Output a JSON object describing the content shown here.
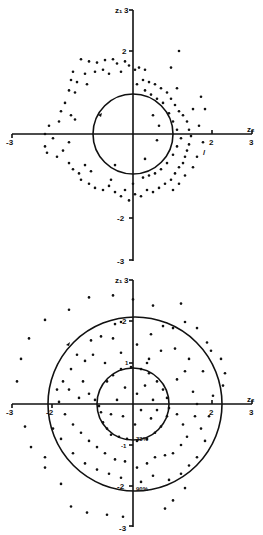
{
  "chart_data": [
    {
      "type": "scatter",
      "title": "",
      "xlabel": "z2",
      "ylabel": "z1",
      "xlim": [
        -3,
        3
      ],
      "ylim": [
        -3,
        3
      ],
      "x_ticks": [
        "-3",
        "2",
        "3"
      ],
      "y_ticks": [
        "3",
        "2",
        "-2",
        "-3"
      ],
      "grid": false,
      "legend": null,
      "annotations": [
        {
          "type": "circle",
          "center": [
            0,
            0
          ],
          "radius": 1.0,
          "with_arrow": true
        },
        {
          "type": "text",
          "text": "/",
          "position": [
            1.8,
            -0.45
          ]
        }
      ],
      "points": [
        [
          -1.3,
          1.8
        ],
        [
          -1.1,
          1.75
        ],
        [
          -0.9,
          1.72
        ],
        [
          -0.7,
          1.78
        ],
        [
          -0.5,
          1.8
        ],
        [
          -0.4,
          1.7
        ],
        [
          -0.2,
          1.75
        ],
        [
          -0.1,
          1.65
        ],
        [
          0.05,
          1.55
        ],
        [
          0.15,
          1.6
        ],
        [
          0.3,
          1.55
        ],
        [
          -1.5,
          1.5
        ],
        [
          -1.2,
          1.45
        ],
        [
          -0.95,
          1.5
        ],
        [
          -0.75,
          1.55
        ],
        [
          -0.6,
          1.45
        ],
        [
          -0.3,
          1.5
        ],
        [
          -1.55,
          1.3
        ],
        [
          -1.4,
          1.25
        ],
        [
          -1.15,
          1.2
        ],
        [
          -1.6,
          1.05
        ],
        [
          -1.45,
          1.0
        ],
        [
          -1.7,
          0.75
        ],
        [
          -1.8,
          0.55
        ],
        [
          -1.85,
          0.3
        ],
        [
          -2.1,
          0.2
        ],
        [
          -2.2,
          0.0
        ],
        [
          -2.0,
          -0.1
        ],
        [
          -2.2,
          -0.3
        ],
        [
          -2.15,
          -0.45
        ],
        [
          -1.9,
          -0.55
        ],
        [
          -1.75,
          -0.4
        ],
        [
          -1.6,
          -0.2
        ],
        [
          -1.55,
          0.45
        ],
        [
          -1.45,
          0.35
        ],
        [
          -1.6,
          -0.7
        ],
        [
          -1.5,
          -0.85
        ],
        [
          -1.35,
          -0.95
        ],
        [
          -1.2,
          -0.75
        ],
        [
          -1.05,
          -0.9
        ],
        [
          -1.3,
          -1.1
        ],
        [
          -1.1,
          -1.2
        ],
        [
          -0.95,
          -1.3
        ],
        [
          -0.75,
          -1.35
        ],
        [
          -0.6,
          -1.25
        ],
        [
          -0.45,
          -1.4
        ],
        [
          -0.3,
          -1.5
        ],
        [
          -0.2,
          -1.35
        ],
        [
          -0.1,
          -1.6
        ],
        [
          0.05,
          -1.45
        ],
        [
          0.2,
          -1.5
        ],
        [
          0.35,
          -1.35
        ],
        [
          0.5,
          -1.4
        ],
        [
          0.65,
          -1.3
        ],
        [
          0.8,
          -1.2
        ],
        [
          0.95,
          -1.1
        ],
        [
          1.05,
          -0.95
        ],
        [
          1.15,
          -0.8
        ],
        [
          1.25,
          -0.7
        ],
        [
          1.3,
          -0.55
        ],
        [
          1.35,
          -0.4
        ],
        [
          1.4,
          -0.25
        ],
        [
          1.45,
          -0.05
        ],
        [
          1.4,
          0.1
        ],
        [
          1.35,
          0.3
        ],
        [
          1.25,
          0.45
        ],
        [
          1.15,
          0.55
        ],
        [
          1.05,
          0.7
        ],
        [
          0.95,
          0.85
        ],
        [
          0.85,
          1.0
        ],
        [
          0.7,
          1.1
        ],
        [
          0.55,
          1.2
        ],
        [
          0.4,
          1.25
        ],
        [
          0.25,
          1.3
        ],
        [
          0.1,
          1.2
        ],
        [
          0.3,
          1.05
        ],
        [
          0.45,
          0.95
        ],
        [
          0.6,
          0.85
        ],
        [
          0.75,
          0.75
        ],
        [
          0.9,
          0.5
        ],
        [
          1.0,
          0.3
        ],
        [
          1.1,
          0.1
        ],
        [
          1.2,
          -0.1
        ],
        [
          1.1,
          -0.3
        ],
        [
          1.0,
          -0.5
        ],
        [
          0.85,
          -0.7
        ],
        [
          0.7,
          -0.85
        ],
        [
          0.55,
          -0.95
        ],
        [
          0.4,
          -1.0
        ],
        [
          0.25,
          -1.05
        ],
        [
          1.7,
          0.9
        ],
        [
          1.8,
          0.6
        ],
        [
          1.5,
          0.6
        ],
        [
          1.65,
          0.2
        ],
        [
          1.75,
          -0.2
        ],
        [
          1.6,
          -0.55
        ],
        [
          1.5,
          -0.8
        ],
        [
          1.3,
          -1.0
        ],
        [
          1.15,
          -1.2
        ],
        [
          1.0,
          -1.35
        ],
        [
          1.15,
          2.0
        ],
        [
          0.95,
          1.6
        ],
        [
          1.1,
          1.1
        ],
        [
          0.5,
          0.45
        ],
        [
          0.65,
          0.2
        ],
        [
          0.3,
          -0.6
        ],
        [
          0.6,
          -0.15
        ],
        [
          0.0,
          -1.2
        ],
        [
          -0.45,
          -0.75
        ],
        [
          -0.55,
          -1.1
        ]
      ]
    },
    {
      "type": "scatter",
      "title": "",
      "xlabel": "z2",
      "ylabel": "z1",
      "xlim": [
        -3,
        3
      ],
      "ylim": [
        -3,
        3
      ],
      "x_ticks": [
        "-3",
        "-2",
        "2",
        "3"
      ],
      "y_ticks": [
        "3",
        "2",
        "1",
        "-1",
        "-2",
        "-3"
      ],
      "grid": false,
      "legend": null,
      "annotations": [
        {
          "type": "circle",
          "center": [
            0,
            0
          ],
          "radius": 0.9,
          "label": "33%",
          "with_arrow": false
        },
        {
          "type": "circle",
          "center": [
            0,
            0
          ],
          "radius": 2.15,
          "label": "90%",
          "with_arrow": true
        }
      ],
      "points": [
        [
          -1.1,
          2.6
        ],
        [
          -0.5,
          2.65
        ],
        [
          0.0,
          2.55
        ],
        [
          1.2,
          2.45
        ],
        [
          0.5,
          2.4
        ],
        [
          -1.6,
          2.3
        ],
        [
          -2.2,
          2.05
        ],
        [
          -2.6,
          1.6
        ],
        [
          -2.8,
          1.1
        ],
        [
          -2.9,
          0.55
        ],
        [
          -2.7,
          -0.55
        ],
        [
          -2.55,
          -1.05
        ],
        [
          -2.2,
          -1.3
        ],
        [
          -2.2,
          -1.55
        ],
        [
          -1.8,
          -1.95
        ],
        [
          -1.55,
          -2.5
        ],
        [
          -1.15,
          -2.65
        ],
        [
          -0.65,
          -2.7
        ],
        [
          -0.25,
          -2.75
        ],
        [
          0.8,
          -2.55
        ],
        [
          1.0,
          -2.35
        ],
        [
          1.3,
          -2.05
        ],
        [
          2.3,
          0.75
        ],
        [
          2.25,
          0.45
        ],
        [
          2.2,
          1.1
        ],
        [
          1.95,
          1.3
        ],
        [
          1.85,
          1.5
        ],
        [
          1.6,
          1.85
        ],
        [
          1.3,
          2.0
        ],
        [
          1.0,
          1.85
        ],
        [
          0.75,
          1.9
        ],
        [
          0.45,
          1.7
        ],
        [
          -0.3,
          2.0
        ],
        [
          -0.45,
          1.95
        ],
        [
          -0.8,
          1.65
        ],
        [
          -0.5,
          1.6
        ],
        [
          -1.05,
          1.55
        ],
        [
          -1.4,
          1.2
        ],
        [
          -1.2,
          1.05
        ],
        [
          -1.55,
          0.85
        ],
        [
          -1.75,
          0.55
        ],
        [
          -1.6,
          0.35
        ],
        [
          -1.35,
          0.15
        ],
        [
          -1.1,
          0.25
        ],
        [
          -0.95,
          0.1
        ],
        [
          -0.85,
          -0.05
        ],
        [
          -0.8,
          -0.2
        ],
        [
          -0.75,
          -0.45
        ],
        [
          -0.65,
          -0.6
        ],
        [
          -0.55,
          -0.75
        ],
        [
          -0.35,
          -0.8
        ],
        [
          -0.15,
          -0.85
        ],
        [
          0.1,
          -0.9
        ],
        [
          0.35,
          -0.85
        ],
        [
          0.55,
          -0.7
        ],
        [
          0.7,
          -0.55
        ],
        [
          0.85,
          -0.3
        ],
        [
          0.9,
          -0.1
        ],
        [
          0.85,
          0.15
        ],
        [
          0.75,
          0.35
        ],
        [
          0.6,
          0.55
        ],
        [
          0.4,
          0.75
        ],
        [
          0.2,
          0.85
        ],
        [
          -0.05,
          0.9
        ],
        [
          -0.3,
          0.85
        ],
        [
          -0.5,
          0.7
        ],
        [
          -0.65,
          0.55
        ],
        [
          0.5,
          0.1
        ],
        [
          0.6,
          -0.15
        ],
        [
          0.45,
          -0.35
        ],
        [
          0.2,
          -0.15
        ],
        [
          0.1,
          0.25
        ],
        [
          -0.2,
          0.4
        ],
        [
          -0.4,
          0.1
        ],
        [
          -0.25,
          -0.3
        ],
        [
          0.05,
          -0.5
        ],
        [
          0.3,
          0.45
        ],
        [
          -0.55,
          -0.25
        ],
        [
          1.1,
          -0.25
        ],
        [
          1.25,
          -0.5
        ],
        [
          1.35,
          -0.8
        ],
        [
          1.2,
          -1.0
        ],
        [
          1.0,
          -1.2
        ],
        [
          0.8,
          -1.25
        ],
        [
          0.55,
          -1.3
        ],
        [
          0.35,
          -1.45
        ],
        [
          0.1,
          -1.55
        ],
        [
          -0.2,
          -1.4
        ],
        [
          -0.45,
          -1.35
        ],
        [
          -0.7,
          -1.2
        ],
        [
          -0.9,
          -1.05
        ],
        [
          -1.1,
          -0.9
        ],
        [
          -1.3,
          -0.7
        ],
        [
          -1.5,
          -0.5
        ],
        [
          -1.7,
          -0.25
        ],
        [
          -1.85,
          0.05
        ],
        [
          -1.9,
          0.35
        ],
        [
          1.5,
          0.3
        ],
        [
          1.6,
          0.0
        ],
        [
          1.55,
          -0.3
        ],
        [
          1.7,
          -0.6
        ],
        [
          1.8,
          -0.9
        ],
        [
          1.6,
          -1.3
        ],
        [
          1.4,
          -1.5
        ],
        [
          1.2,
          -1.7
        ],
        [
          0.9,
          -1.85
        ],
        [
          0.5,
          -1.75
        ],
        [
          0.2,
          -1.9
        ],
        [
          -0.3,
          -1.8
        ],
        [
          -0.6,
          -1.7
        ],
        [
          -0.9,
          -1.6
        ],
        [
          -1.2,
          -1.45
        ],
        [
          -1.5,
          -1.2
        ],
        [
          -1.8,
          -0.85
        ],
        [
          -2.0,
          -0.6
        ],
        [
          1.9,
          -0.3
        ],
        [
          2.0,
          0.2
        ],
        [
          1.75,
          0.8
        ],
        [
          1.4,
          1.1
        ],
        [
          1.05,
          1.35
        ],
        [
          0.7,
          1.3
        ],
        [
          0.4,
          1.1
        ],
        [
          1.1,
          0.6
        ],
        [
          1.3,
          0.8
        ],
        [
          -1.0,
          1.2
        ],
        [
          -0.7,
          1.0
        ],
        [
          -0.3,
          1.25
        ],
        [
          0.1,
          1.45
        ],
        [
          0.35,
          1.0
        ],
        [
          -1.25,
          0.55
        ]
      ]
    }
  ],
  "plots": {
    "top": {
      "y_axis_title": "z₁",
      "x_axis_title": "z₂",
      "y_label_top": "3",
      "y_label_2": "2",
      "y_label_neg2": "-2",
      "y_label_neg3": "-3",
      "x_label_neg3": "-3",
      "x_label_2": "2",
      "x_label_3": "3",
      "mark": "/"
    },
    "bottom": {
      "y_axis_title": "z₁",
      "x_axis_title": "z₂",
      "y_label_top": "3",
      "y_label_2": "2",
      "y_label_1": "1",
      "y_label_neg1": "-1",
      "y_label_neg2": "-2",
      "y_label_neg3": "-3",
      "x_label_neg3": "-3",
      "x_label_neg2": "-2",
      "x_label_2": "2",
      "x_label_3": "3",
      "inner_circle_label": "33%",
      "outer_circle_label": "90%"
    }
  }
}
